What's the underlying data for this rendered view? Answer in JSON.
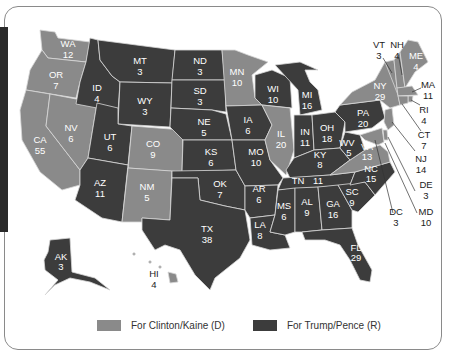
{
  "colors": {
    "democrat": "#8a8a8a",
    "republican": "#3c3c3c",
    "border": "#d8d8d8",
    "frame": "#8a8a8a",
    "sidebar": "#2a2a2a"
  },
  "legend": [
    {
      "label": "For Clinton/Kaine (D)",
      "party": "democrat"
    },
    {
      "label": "For Trump/Pence (R)",
      "party": "republican"
    }
  ],
  "states": [
    {
      "abbr": "WA",
      "votes": "12",
      "party": "D"
    },
    {
      "abbr": "OR",
      "votes": "7",
      "party": "D"
    },
    {
      "abbr": "CA",
      "votes": "55",
      "party": "D"
    },
    {
      "abbr": "NV",
      "votes": "6",
      "party": "D"
    },
    {
      "abbr": "ID",
      "votes": "4",
      "party": "R"
    },
    {
      "abbr": "MT",
      "votes": "3",
      "party": "R"
    },
    {
      "abbr": "WY",
      "votes": "3",
      "party": "R"
    },
    {
      "abbr": "UT",
      "votes": "6",
      "party": "R"
    },
    {
      "abbr": "CO",
      "votes": "9",
      "party": "D"
    },
    {
      "abbr": "AZ",
      "votes": "11",
      "party": "R"
    },
    {
      "abbr": "NM",
      "votes": "5",
      "party": "D"
    },
    {
      "abbr": "ND",
      "votes": "3",
      "party": "R"
    },
    {
      "abbr": "SD",
      "votes": "3",
      "party": "R"
    },
    {
      "abbr": "NE",
      "votes": "5",
      "party": "R"
    },
    {
      "abbr": "KS",
      "votes": "6",
      "party": "R"
    },
    {
      "abbr": "OK",
      "votes": "7",
      "party": "R"
    },
    {
      "abbr": "TX",
      "votes": "38",
      "party": "R"
    },
    {
      "abbr": "MN",
      "votes": "10",
      "party": "D"
    },
    {
      "abbr": "IA",
      "votes": "6",
      "party": "R"
    },
    {
      "abbr": "MO",
      "votes": "10",
      "party": "R"
    },
    {
      "abbr": "AR",
      "votes": "6",
      "party": "R"
    },
    {
      "abbr": "LA",
      "votes": "8",
      "party": "R"
    },
    {
      "abbr": "WI",
      "votes": "10",
      "party": "R"
    },
    {
      "abbr": "IL",
      "votes": "20",
      "party": "D"
    },
    {
      "abbr": "MI",
      "votes": "16",
      "party": "R"
    },
    {
      "abbr": "IN",
      "votes": "11",
      "party": "R"
    },
    {
      "abbr": "OH",
      "votes": "18",
      "party": "R"
    },
    {
      "abbr": "KY",
      "votes": "8",
      "party": "R"
    },
    {
      "abbr": "TN",
      "votes": "11",
      "party": "R"
    },
    {
      "abbr": "MS",
      "votes": "6",
      "party": "R"
    },
    {
      "abbr": "AL",
      "votes": "9",
      "party": "R"
    },
    {
      "abbr": "GA",
      "votes": "16",
      "party": "R"
    },
    {
      "abbr": "FL",
      "votes": "29",
      "party": "R"
    },
    {
      "abbr": "SC",
      "votes": "9",
      "party": "R"
    },
    {
      "abbr": "NC",
      "votes": "15",
      "party": "R"
    },
    {
      "abbr": "VA",
      "votes": "13",
      "party": "D"
    },
    {
      "abbr": "WV",
      "votes": "5",
      "party": "R"
    },
    {
      "abbr": "PA",
      "votes": "20",
      "party": "R"
    },
    {
      "abbr": "NY",
      "votes": "29",
      "party": "D"
    },
    {
      "abbr": "VT",
      "votes": "3",
      "party": "D"
    },
    {
      "abbr": "NH",
      "votes": "4",
      "party": "D"
    },
    {
      "abbr": "ME",
      "votes": "4",
      "party": "D"
    },
    {
      "abbr": "MA",
      "votes": "11",
      "party": "D"
    },
    {
      "abbr": "RI",
      "votes": "4",
      "party": "D"
    },
    {
      "abbr": "CT",
      "votes": "7",
      "party": "D"
    },
    {
      "abbr": "NJ",
      "votes": "14",
      "party": "D"
    },
    {
      "abbr": "DE",
      "votes": "3",
      "party": "D"
    },
    {
      "abbr": "MD",
      "votes": "10",
      "party": "D"
    },
    {
      "abbr": "DC",
      "votes": "3",
      "party": "D"
    },
    {
      "abbr": "AK",
      "votes": "3",
      "party": "R"
    },
    {
      "abbr": "HI",
      "votes": "4",
      "party": "D"
    }
  ]
}
